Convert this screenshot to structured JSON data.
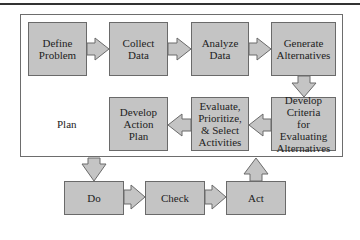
{
  "diagram": {
    "plan_label": "Plan",
    "plan_steps": [
      {
        "id": "define",
        "label": "Define\nProblem"
      },
      {
        "id": "collect",
        "label": "Collect\nData"
      },
      {
        "id": "analyze",
        "label": "Analyze\nData"
      },
      {
        "id": "generate",
        "label": "Generate\nAlternatives"
      },
      {
        "id": "criteria",
        "label": "Develop\nCriteria\nfor Evaluating\nAlternatives"
      },
      {
        "id": "evaluate",
        "label": "Evaluate,\nPrioritize,\n& Select\nActivities"
      },
      {
        "id": "action",
        "label": "Develop\nAction\nPlan"
      }
    ],
    "cycle_steps": [
      {
        "id": "do",
        "label": "Do"
      },
      {
        "id": "check",
        "label": "Check"
      },
      {
        "id": "act",
        "label": "Act"
      }
    ],
    "flow": [
      "Define Problem -> Collect Data",
      "Collect Data -> Analyze Data",
      "Analyze Data -> Generate Alternatives",
      "Generate Alternatives -> Develop Criteria for Evaluating Alternatives",
      "Develop Criteria -> Evaluate, Prioritize, & Select Activities",
      "Evaluate -> Develop Action Plan",
      "Plan -> Do",
      "Do -> Check",
      "Check -> Act",
      "Act -> Plan"
    ],
    "colors": {
      "box_fill": "#c4c4c4",
      "box_border": "#6a6a6a",
      "frame_border": "#6d6d6d"
    }
  }
}
